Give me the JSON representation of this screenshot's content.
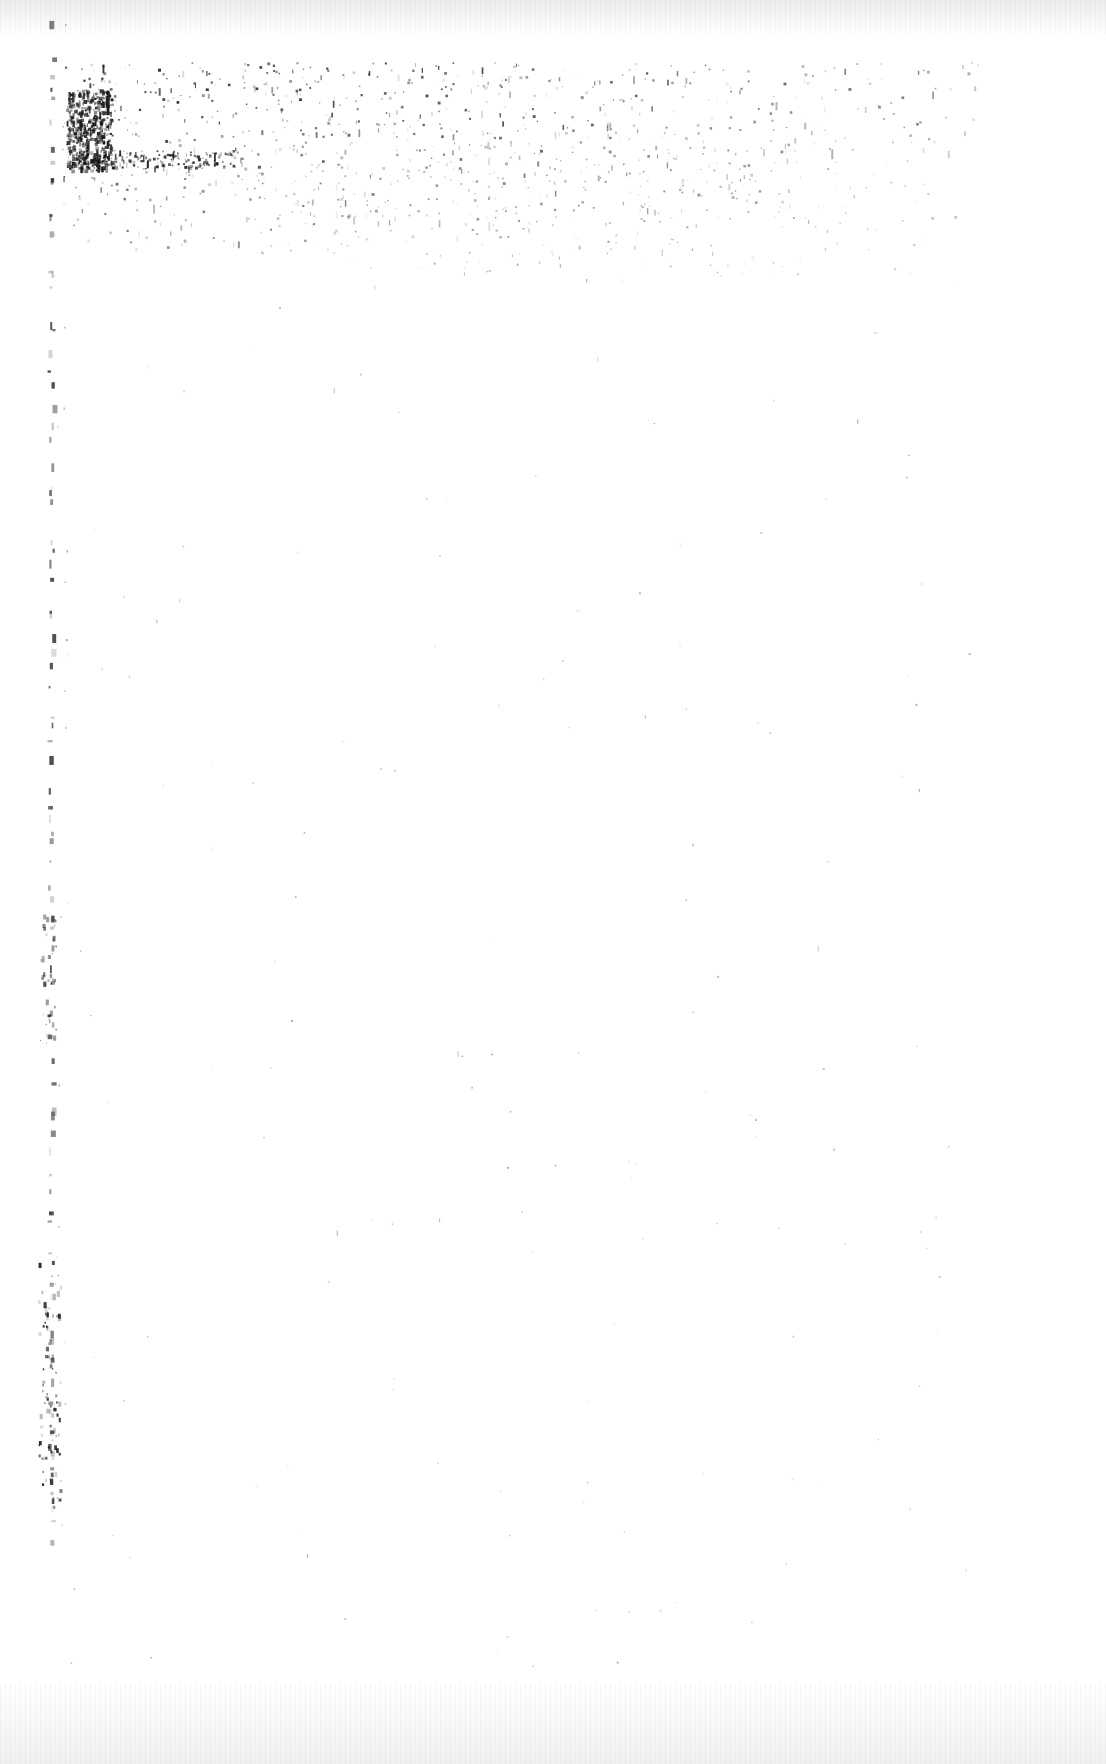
{
  "document": {
    "kind": "scanned-page",
    "condition": "severely-degraded",
    "legible_text": "",
    "page_width": 1106,
    "page_height": 1764,
    "background_color": "#ffffff",
    "ink_color": "#1a1a1a"
  },
  "scan_edges": {
    "top": {
      "height": 34,
      "color_start": "#ececed",
      "color_end": "#ffffff"
    },
    "bottom": {
      "height": 80,
      "color_start": "#f0f0f1",
      "color_end": "#ffffff"
    }
  },
  "noise_fields": [
    {
      "name": "headline-speckle-band",
      "description": "dense residue of a destroyed heading / first text lines",
      "x": 62,
      "y": 62,
      "width": 920,
      "height": 190,
      "count": 1700,
      "seed": 20240117,
      "min_size": 1,
      "max_size": 3,
      "min_alpha": 0.1,
      "max_alpha": 0.96,
      "falloff": "radial-topleft"
    },
    {
      "name": "headline-core-cluster",
      "description": "darkest surviving ink mass at the left of the heading",
      "x": 66,
      "y": 88,
      "width": 46,
      "height": 82,
      "count": 430,
      "seed": 777003,
      "min_size": 1,
      "max_size": 4,
      "min_alpha": 0.3,
      "max_alpha": 1.0,
      "falloff": "none"
    },
    {
      "name": "headline-baseline-trail",
      "description": "horizontal smear along the heading baseline",
      "x": 74,
      "y": 150,
      "width": 160,
      "height": 18,
      "count": 190,
      "seed": 314159,
      "min_size": 1,
      "max_size": 3,
      "min_alpha": 0.22,
      "max_alpha": 0.94,
      "falloff": "none"
    },
    {
      "name": "secondary-speckle-drift",
      "description": "sparser residue drifting right and downward from the band",
      "x": 230,
      "y": 120,
      "width": 700,
      "height": 160,
      "count": 620,
      "seed": 88211,
      "min_size": 1,
      "max_size": 2,
      "min_alpha": 0.07,
      "max_alpha": 0.62,
      "falloff": "radial-center"
    },
    {
      "name": "body-field-scatter",
      "description": "isolated specks over the otherwise blank body of the page",
      "x": 70,
      "y": 270,
      "width": 900,
      "height": 1400,
      "count": 150,
      "seed": 4242,
      "min_size": 1,
      "max_size": 2,
      "min_alpha": 0.06,
      "max_alpha": 0.44,
      "falloff": "none"
    }
  ],
  "margin_rule": {
    "name": "left-margin-mark-column",
    "description": "column of periodic faint marks down the left margin, remnant of a ruled edge",
    "x": 50,
    "y_start": 30,
    "y_end": 1560,
    "count": 86,
    "seed": 9091,
    "width": 4,
    "min_alpha": 0.1,
    "max_alpha": 0.78
  },
  "margin_clusters": [
    {
      "name": "margin-cluster-upper",
      "x": 40,
      "y": 914,
      "width": 16,
      "height": 130,
      "count": 40,
      "seed": 6061,
      "min_alpha": 0.12,
      "max_alpha": 0.7
    },
    {
      "name": "margin-cluster-lower",
      "x": 38,
      "y": 1258,
      "width": 22,
      "height": 250,
      "count": 95,
      "seed": 5150,
      "min_alpha": 0.14,
      "max_alpha": 0.95
    }
  ],
  "page_regions": {
    "header_band_label": "",
    "body_label": "",
    "footer_band_label": ""
  }
}
